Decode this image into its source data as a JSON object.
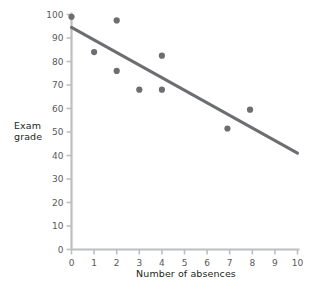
{
  "chart_data": {
    "type": "scatter",
    "title": "",
    "xlabel": "Number of absences",
    "ylabel": "Exam grade",
    "ylabel_lines": [
      "Exam",
      "grade"
    ],
    "xlim": [
      0,
      10
    ],
    "ylim": [
      0,
      100
    ],
    "xticks": [
      0,
      1,
      2,
      3,
      4,
      5,
      6,
      7,
      8,
      9,
      10
    ],
    "xtick_labels": [
      "0",
      "1",
      "2",
      "3",
      "4",
      "5",
      "6",
      "7",
      "8",
      "9",
      "10"
    ],
    "yticks": [
      0,
      10,
      20,
      30,
      40,
      50,
      60,
      70,
      80,
      90,
      100
    ],
    "ytick_labels": [
      "0",
      "10",
      "20",
      "30",
      "40",
      "50",
      "60",
      "70",
      "80",
      "90",
      "100"
    ],
    "grid": false,
    "legend": "none",
    "points": [
      {
        "x": 0,
        "y": 99
      },
      {
        "x": 1,
        "y": 84
      },
      {
        "x": 2,
        "y": 97.5
      },
      {
        "x": 2,
        "y": 76
      },
      {
        "x": 3,
        "y": 68
      },
      {
        "x": 4,
        "y": 82.5
      },
      {
        "x": 4,
        "y": 68
      },
      {
        "x": 6.9,
        "y": 51.5
      },
      {
        "x": 7.9,
        "y": 59.5
      }
    ],
    "trendline": {
      "x0": 0,
      "y0": 94.5,
      "x1": 10,
      "y1": 41
    },
    "colors": {
      "point": "#6d6e71",
      "trendline": "#6d6e71",
      "axis": "#bcbec0",
      "tick_text": "#58595b",
      "axis_title": "#231f20",
      "background": "#ffffff"
    }
  }
}
